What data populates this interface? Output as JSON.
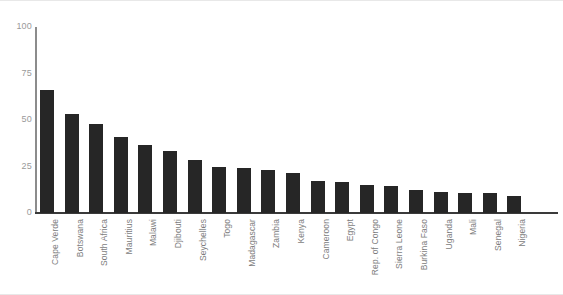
{
  "chart_data": {
    "type": "bar",
    "title": "",
    "xlabel": "",
    "ylabel": "",
    "ylim": [
      0,
      100
    ],
    "yticks": [
      0,
      25,
      50,
      75,
      100
    ],
    "grid": false,
    "legend": "none",
    "orientation": "vertical",
    "bar_color": "#262626",
    "axis_color": "#8c8c8c",
    "tick_label_color": "#9a9a9a",
    "category_label_color": "#7d7d7d",
    "category_label_rotation": -90,
    "categories": [
      "Cape Verde",
      "Botswana",
      "South Africa",
      "Mauritius",
      "Malawi",
      "Djibouti",
      "Seychelles",
      "Togo",
      "Madagascar",
      "Zambia",
      "Kenya",
      "Cameroon",
      "Egypt",
      "Rep. of Congo",
      "Sierra Leone",
      "Burkina Faso",
      "Uganda",
      "Mali",
      "Senegal",
      "Nigeria"
    ],
    "values": [
      66,
      53,
      48,
      41,
      36.5,
      33.5,
      28.5,
      25,
      24,
      23,
      21.5,
      17,
      16.5,
      15,
      14.5,
      12.5,
      11.5,
      11,
      11,
      9
    ]
  }
}
